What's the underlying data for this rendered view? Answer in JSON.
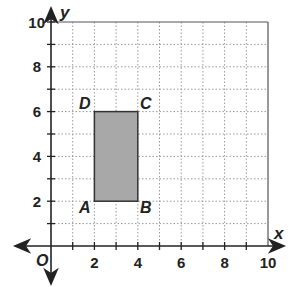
{
  "diagram": {
    "type": "coordinate-plane",
    "x_axis": {
      "label": "x",
      "min": 0,
      "max": 10,
      "ticks": [
        2,
        4,
        6,
        8,
        10
      ]
    },
    "y_axis": {
      "label": "y",
      "min": 0,
      "max": 10,
      "ticks": [
        2,
        4,
        6,
        8,
        10
      ]
    },
    "origin_label": "O",
    "grid": "dotted, 1-unit spacing",
    "shape": {
      "type": "rectangle",
      "fill": "#a8a8a8",
      "vertices": [
        {
          "label": "A",
          "x": 2,
          "y": 2
        },
        {
          "label": "B",
          "x": 4,
          "y": 2
        },
        {
          "label": "C",
          "x": 4,
          "y": 6
        },
        {
          "label": "D",
          "x": 2,
          "y": 6
        }
      ]
    }
  },
  "labels": {
    "x_axis_name": "x",
    "y_axis_name": "y",
    "origin": "O",
    "x_ticks": [
      "2",
      "4",
      "6",
      "8",
      "10"
    ],
    "y_ticks": [
      "2",
      "4",
      "6",
      "8",
      "10"
    ],
    "vertex_a": "A",
    "vertex_b": "B",
    "vertex_c": "C",
    "vertex_d": "D"
  }
}
